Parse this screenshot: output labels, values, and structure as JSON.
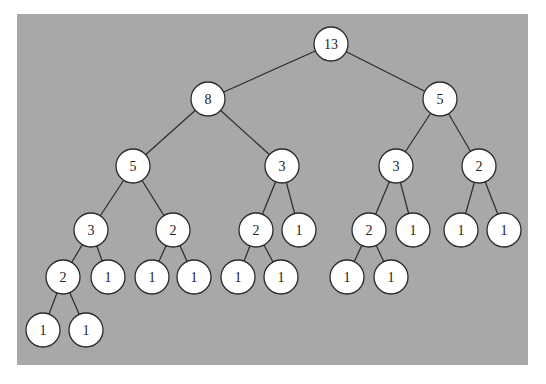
{
  "diagram": {
    "type": "tree",
    "background_color": "#a8a8a8",
    "node_fill": "#ffffff",
    "node_stroke": "#2b2b2b",
    "node_radius": 17,
    "nodes": [
      {
        "id": "n0",
        "label": "13",
        "x": 331,
        "y": 44
      },
      {
        "id": "n1",
        "label": "8",
        "x": 208,
        "y": 99
      },
      {
        "id": "n2",
        "label": "5",
        "x": 440,
        "y": 99
      },
      {
        "id": "n3",
        "label": "5",
        "x": 133,
        "y": 166
      },
      {
        "id": "n4",
        "label": "3",
        "x": 282,
        "y": 166
      },
      {
        "id": "n5",
        "label": "3",
        "x": 396,
        "y": 166
      },
      {
        "id": "n6",
        "label": "2",
        "x": 479,
        "y": 166
      },
      {
        "id": "n7",
        "label": "3",
        "x": 91,
        "y": 230
      },
      {
        "id": "n8",
        "label": "2",
        "x": 173,
        "y": 230
      },
      {
        "id": "n9",
        "label": "2",
        "x": 256,
        "y": 230
      },
      {
        "id": "n10",
        "label": "1",
        "x": 299,
        "y": 230
      },
      {
        "id": "n11",
        "label": "2",
        "x": 369,
        "y": 230
      },
      {
        "id": "n12",
        "label": "1",
        "x": 413,
        "y": 230
      },
      {
        "id": "n13",
        "label": "1",
        "x": 461,
        "y": 230
      },
      {
        "id": "n14",
        "label": "1",
        "x": 504,
        "y": 230
      },
      {
        "id": "n15",
        "label": "2",
        "x": 63,
        "y": 277
      },
      {
        "id": "n16",
        "label": "1",
        "x": 108,
        "y": 277
      },
      {
        "id": "n17",
        "label": "1",
        "x": 152,
        "y": 277
      },
      {
        "id": "n18",
        "label": "1",
        "x": 194,
        "y": 277
      },
      {
        "id": "n19",
        "label": "1",
        "x": 238,
        "y": 277
      },
      {
        "id": "n20",
        "label": "1",
        "x": 281,
        "y": 277
      },
      {
        "id": "n21",
        "label": "1",
        "x": 347,
        "y": 277
      },
      {
        "id": "n22",
        "label": "1",
        "x": 391,
        "y": 277
      },
      {
        "id": "n23",
        "label": "1",
        "x": 43,
        "y": 330
      },
      {
        "id": "n24",
        "label": "1",
        "x": 86,
        "y": 330
      }
    ],
    "edges": [
      [
        "n0",
        "n1"
      ],
      [
        "n0",
        "n2"
      ],
      [
        "n1",
        "n3"
      ],
      [
        "n1",
        "n4"
      ],
      [
        "n2",
        "n5"
      ],
      [
        "n2",
        "n6"
      ],
      [
        "n3",
        "n7"
      ],
      [
        "n3",
        "n8"
      ],
      [
        "n4",
        "n9"
      ],
      [
        "n4",
        "n10"
      ],
      [
        "n5",
        "n11"
      ],
      [
        "n5",
        "n12"
      ],
      [
        "n6",
        "n13"
      ],
      [
        "n6",
        "n14"
      ],
      [
        "n7",
        "n15"
      ],
      [
        "n7",
        "n16"
      ],
      [
        "n8",
        "n17"
      ],
      [
        "n8",
        "n18"
      ],
      [
        "n9",
        "n19"
      ],
      [
        "n9",
        "n20"
      ],
      [
        "n11",
        "n21"
      ],
      [
        "n11",
        "n22"
      ],
      [
        "n15",
        "n23"
      ],
      [
        "n15",
        "n24"
      ]
    ]
  },
  "caption": {
    "text": ""
  }
}
